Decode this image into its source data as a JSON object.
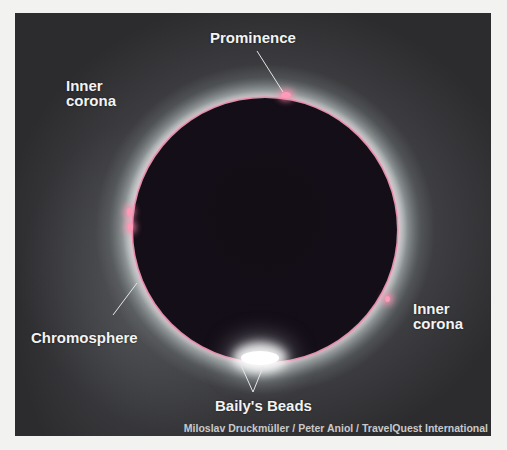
{
  "figure": {
    "labels": {
      "prominence": "Prominence",
      "inner_corona_left": "Inner\ncorona",
      "inner_corona_left_line1": "Inner",
      "inner_corona_left_line2": "corona",
      "inner_corona_right_line1": "Inner",
      "inner_corona_right_line2": "corona",
      "chromosphere": "Chromosphere",
      "bailys_beads": "Baily's Beads"
    },
    "credit": "Miloslav Druckmüller / Peter Aniol / TravelQuest International",
    "colors": {
      "background": "#2c2c2f",
      "moon": "#130d16",
      "chromosphere": "#e88aa8",
      "label_text": "#f3f3f3",
      "credit_text": "#c9c9c9"
    }
  }
}
